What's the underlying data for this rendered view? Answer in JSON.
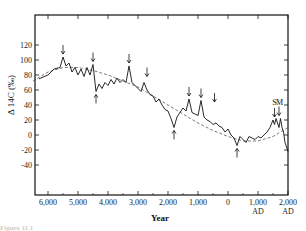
{
  "chart_data": {
    "type": "line",
    "title": "",
    "xlabel": "Year",
    "ylabel": "Δ 14C (‰)",
    "x_ticks": [
      {
        "value": -6000,
        "label": "6,000",
        "sub": ""
      },
      {
        "value": -5000,
        "label": "5,000",
        "sub": ""
      },
      {
        "value": -4000,
        "label": "4,000",
        "sub": ""
      },
      {
        "value": -3000,
        "label": "3,000",
        "sub": ""
      },
      {
        "value": -2000,
        "label": "2,000",
        "sub": ""
      },
      {
        "value": -1000,
        "label": "1,000",
        "sub": ""
      },
      {
        "value": 0,
        "label": "0",
        "sub": ""
      },
      {
        "value": 1000,
        "label": "1,000",
        "sub": "AD"
      },
      {
        "value": 2000,
        "label": "2,000",
        "sub": "AD"
      }
    ],
    "y_ticks": [
      120,
      100,
      80,
      60,
      40,
      20,
      0,
      -20,
      -40
    ],
    "xlim": [
      -6500,
      2000
    ],
    "ylim": [
      -120,
      160
    ],
    "grid": false,
    "legend": "none",
    "series": [
      {
        "name": "Δ14C record",
        "style": "solid",
        "x": [
          -6300,
          -6000,
          -5800,
          -5600,
          -5500,
          -5400,
          -5300,
          -5200,
          -5100,
          -5000,
          -4900,
          -4800,
          -4700,
          -4600,
          -4500,
          -4400,
          -4300,
          -4200,
          -4100,
          -4000,
          -3900,
          -3800,
          -3700,
          -3600,
          -3500,
          -3400,
          -3300,
          -3200,
          -3100,
          -3000,
          -2900,
          -2800,
          -2700,
          -2600,
          -2500,
          -2400,
          -2300,
          -2200,
          -2100,
          -2000,
          -1900,
          -1800,
          -1700,
          -1600,
          -1500,
          -1400,
          -1300,
          -1200,
          -1100,
          -1000,
          -900,
          -800,
          -700,
          -600,
          -500,
          -400,
          -300,
          -200,
          -100,
          0,
          100,
          200,
          300,
          400,
          500,
          600,
          700,
          800,
          900,
          1000,
          1100,
          1200,
          1300,
          1400,
          1500,
          1550,
          1600,
          1650,
          1700,
          1750,
          1800,
          1850,
          1900,
          1950,
          2000
        ],
        "values": [
          75,
          80,
          88,
          90,
          104,
          92,
          96,
          84,
          90,
          80,
          88,
          78,
          90,
          80,
          94,
          58,
          68,
          62,
          70,
          66,
          74,
          68,
          76,
          70,
          74,
          70,
          92,
          70,
          66,
          62,
          58,
          70,
          60,
          54,
          52,
          44,
          48,
          40,
          34,
          32,
          22,
          10,
          24,
          30,
          36,
          32,
          48,
          30,
          28,
          26,
          46,
          24,
          20,
          18,
          14,
          16,
          12,
          10,
          4,
          8,
          0,
          -4,
          -14,
          -2,
          -6,
          -10,
          -2,
          -4,
          -6,
          -2,
          -4,
          0,
          4,
          10,
          20,
          14,
          22,
          16,
          10,
          22,
          10,
          4,
          -10,
          -16,
          -22
        ]
      },
      {
        "name": "Long-term trend",
        "style": "dashed",
        "x": [
          -6500,
          -6000,
          -5500,
          -5000,
          -4500,
          -4000,
          -3500,
          -3000,
          -2500,
          -2000,
          -1500,
          -1000,
          -500,
          0,
          500,
          1000,
          1500,
          2000
        ],
        "values": [
          72,
          84,
          90,
          90,
          86,
          80,
          72,
          64,
          52,
          40,
          28,
          16,
          6,
          -2,
          -8,
          -8,
          -2,
          10
        ]
      }
    ],
    "annotations": [
      {
        "type": "arrow-down",
        "x": -5500,
        "y": 104
      },
      {
        "type": "arrow-down",
        "x": -4500,
        "y": 94
      },
      {
        "type": "arrow-up",
        "x": -4400,
        "y": 58
      },
      {
        "type": "arrow-down",
        "x": -3300,
        "y": 92
      },
      {
        "type": "arrow-down",
        "x": -2700,
        "y": 74
      },
      {
        "type": "arrow-up",
        "x": -1800,
        "y": 10
      },
      {
        "type": "arrow-down",
        "x": -1300,
        "y": 48
      },
      {
        "type": "arrow-down",
        "x": -900,
        "y": 46
      },
      {
        "type": "arrow-down",
        "x": -450,
        "y": 40
      },
      {
        "type": "arrow-up",
        "x": 300,
        "y": -14
      },
      {
        "type": "arrow-down",
        "x": 1550,
        "y": 20
      },
      {
        "type": "arrow-down",
        "x": 1700,
        "y": 22
      },
      {
        "type": "text",
        "label": "S",
        "x": 1550,
        "y": 30
      },
      {
        "type": "text",
        "label": "M",
        "x": 1720,
        "y": 30
      }
    ]
  },
  "labels": {
    "xlabel": "Year",
    "ylabel": "Δ 14C (‰)",
    "annot_s": "S",
    "annot_m": "M",
    "caption": "Figure 11.1"
  }
}
